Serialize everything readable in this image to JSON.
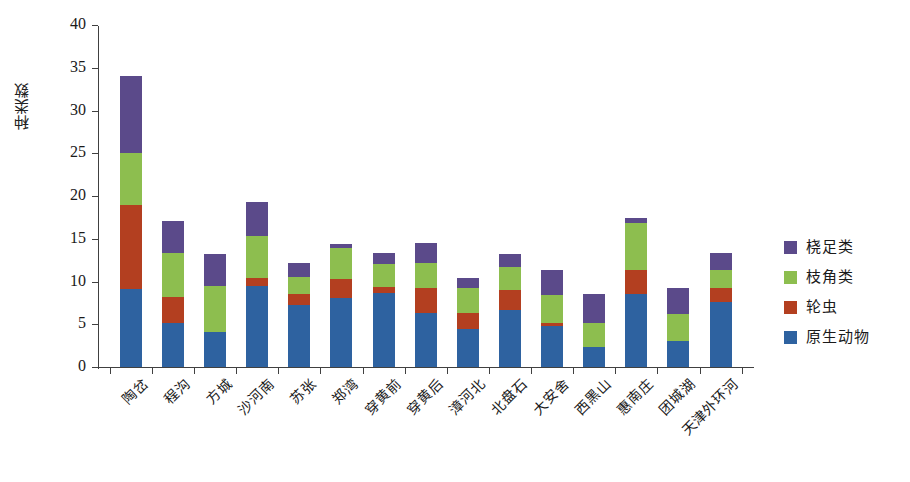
{
  "chart_data": {
    "type": "bar",
    "subtype": "stacked-bar",
    "title": "",
    "xlabel": "",
    "ylabel": "种类数",
    "ylim": [
      0,
      40
    ],
    "yticks": [
      0,
      5,
      10,
      15,
      20,
      25,
      30,
      35,
      40
    ],
    "grid": false,
    "legend_position": "right",
    "categories": [
      "陶岔",
      "程沟",
      "方城",
      "沙河南",
      "苏张",
      "郑湾",
      "穿黄前",
      "穿黄后",
      "漳河北",
      "北盘石",
      "大安舍",
      "西黑山",
      "惠南庄",
      "团城湖",
      "天津外环河"
    ],
    "series": [
      {
        "name": "原生动物",
        "color": "#2e62a0",
        "values": [
          9.1,
          5.2,
          4.1,
          9.5,
          7.3,
          8.1,
          8.6,
          6.3,
          4.4,
          6.7,
          4.8,
          2.3,
          8.5,
          3.1,
          7.6
        ]
      },
      {
        "name": "轮虫",
        "color": "#b33f20",
        "values": [
          9.9,
          3.0,
          0.0,
          0.9,
          1.2,
          2.2,
          0.8,
          3.0,
          1.9,
          2.3,
          0.3,
          0.0,
          2.9,
          0.0,
          1.7
        ]
      },
      {
        "name": "枝角类",
        "color": "#8dbe4f",
        "values": [
          6.0,
          5.1,
          5.4,
          4.9,
          2.0,
          3.6,
          2.6,
          2.9,
          3.0,
          2.7,
          3.3,
          2.9,
          5.5,
          3.1,
          2.0
        ]
      },
      {
        "name": "桡足类",
        "color": "#5b4a8a",
        "values": [
          9.0,
          3.8,
          3.7,
          4.0,
          1.7,
          0.5,
          1.3,
          2.3,
          1.1,
          1.5,
          3.0,
          3.3,
          0.5,
          3.1,
          2.0
        ]
      }
    ],
    "totals": [
      34.0,
      17.1,
      13.2,
      19.3,
      12.2,
      14.4,
      13.3,
      14.5,
      10.4,
      13.2,
      11.4,
      8.5,
      17.4,
      9.3,
      13.3
    ]
  },
  "legend": {
    "items": [
      {
        "label": "桡足类",
        "color": "#5b4a8a"
      },
      {
        "label": "枝角类",
        "color": "#8dbe4f"
      },
      {
        "label": "轮虫",
        "color": "#b33f20"
      },
      {
        "label": "原生动物",
        "color": "#2e62a0"
      }
    ]
  },
  "axis": {
    "y_title": "种类数"
  }
}
